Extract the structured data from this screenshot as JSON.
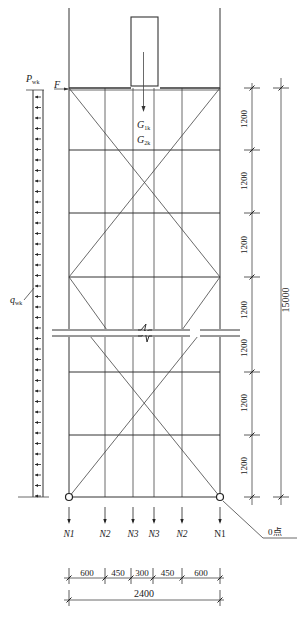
{
  "diagram": {
    "type": "scaffold structural calculation diagram",
    "loads": {
      "wind_line_label": "P",
      "wind_line_sub": "wk",
      "horizontal_force_label": "F",
      "distributed_wind_label": "q",
      "distributed_wind_sub": "wk",
      "self_weight_1": "G",
      "self_weight_1_sub": "1k",
      "self_weight_2": "G",
      "self_weight_2_sub": "2k"
    },
    "reactions": [
      {
        "label": "N1",
        "italic": true
      },
      {
        "label": "N2",
        "italic": true
      },
      {
        "label": "N3",
        "italic": true
      },
      {
        "label": "N3",
        "italic": true
      },
      {
        "label": "N2",
        "italic": true
      },
      {
        "label": "N1",
        "italic": false
      }
    ],
    "origin_label": "0点",
    "vertical_dimensions": {
      "segments": [
        "1200",
        "1200",
        "1200",
        "1200",
        "1200",
        "1200",
        "1200"
      ],
      "total": "15000"
    },
    "horizontal_dimensions": {
      "segments": [
        "600",
        "450",
        "300",
        "450",
        "600"
      ],
      "total": "2400"
    }
  }
}
